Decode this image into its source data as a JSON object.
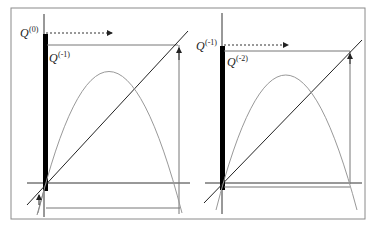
{
  "figure": {
    "panels": [
      {
        "id": "left",
        "label_top": "Q",
        "label_top_sup": "(0)",
        "label_inner": "Q",
        "label_inner_sup": "(-1)"
      },
      {
        "id": "right",
        "label_top": "Q",
        "label_top_sup": "(-1)",
        "label_inner": "Q",
        "label_inner_sup": "(-2)"
      }
    ],
    "colors": {
      "frame": "#888888",
      "axis": "#333333",
      "diagonal": "#222222",
      "parabola": "#999999",
      "bar": "#000000",
      "dotted_arrow": "#333333"
    }
  }
}
